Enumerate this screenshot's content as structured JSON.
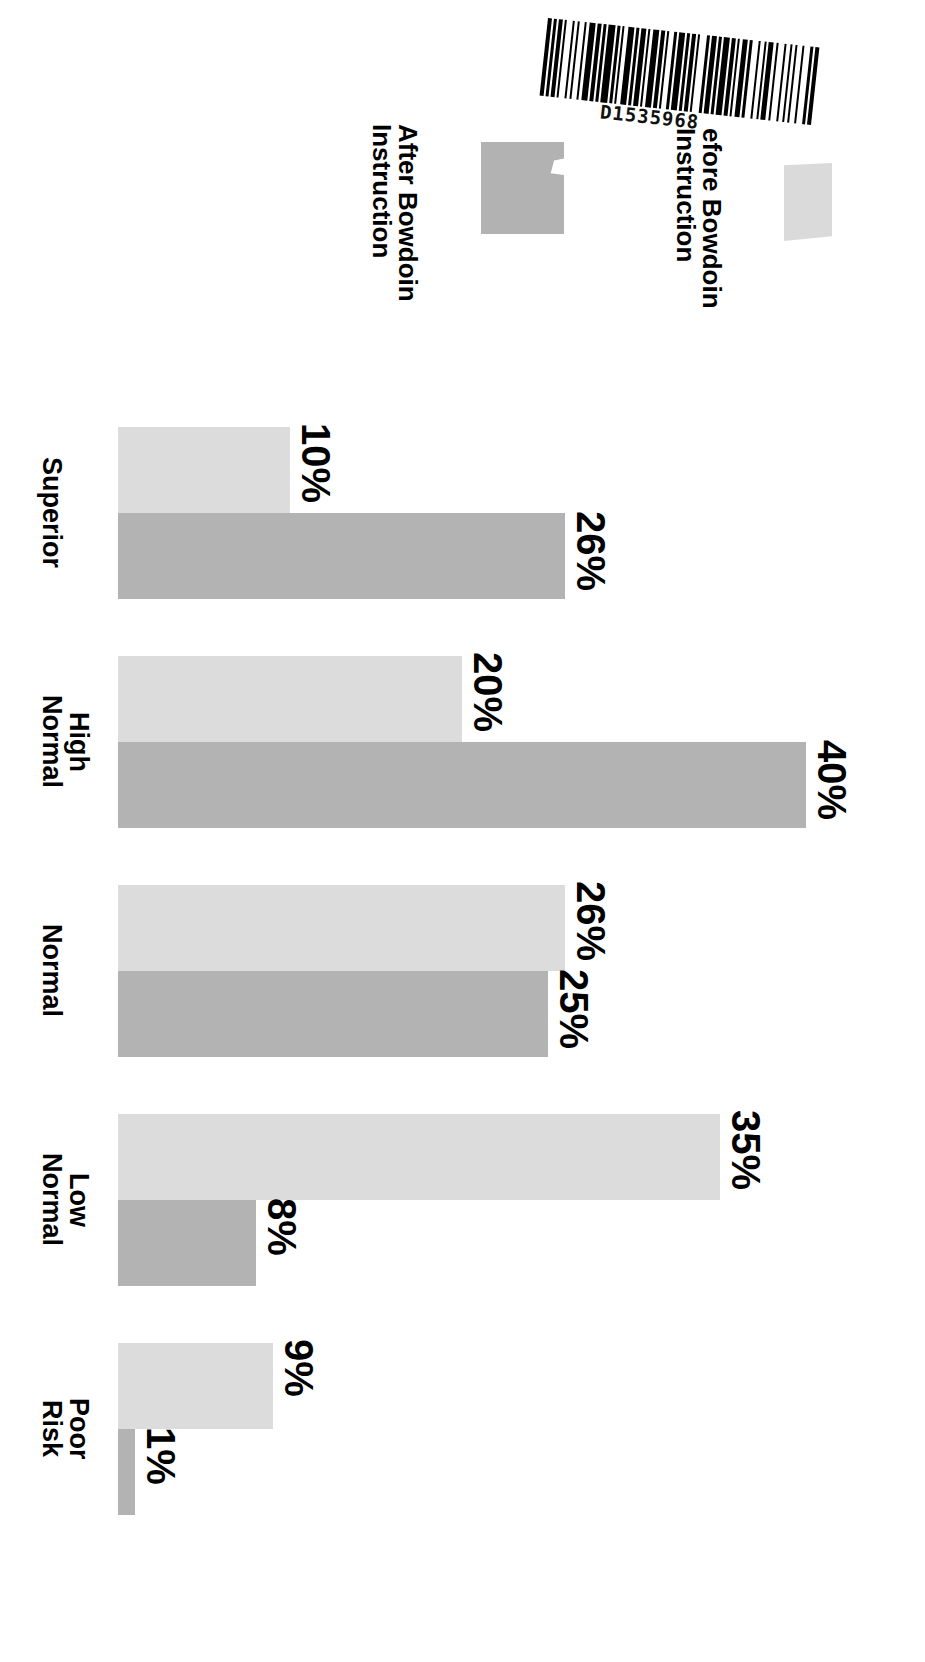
{
  "barcode": {
    "name": "barcode",
    "text": "D1535968"
  },
  "legend": {
    "entries": [
      {
        "key": "after",
        "label": "After Bowdoin\nInstruction",
        "swatch_color": "#b2b2b2",
        "series": "After Bowdoin Instruction"
      },
      {
        "key": "before",
        "label": "efore Bowdoin\nInstruction",
        "swatch_color": "#dadada",
        "series": "Before Bowdoin Instruction"
      }
    ]
  },
  "chart_data": {
    "type": "bar",
    "orientation": "horizontal",
    "title": "",
    "subtitle": "",
    "xlabel": "",
    "ylabel": "",
    "grid": false,
    "legend_position": "top",
    "value_suffix": "%",
    "categories": [
      "Superior",
      "High\nNormal",
      "Normal",
      "Low\nNormal",
      "Poor\nRisk"
    ],
    "series": [
      {
        "name": "Before Bowdoin Instruction",
        "color": "#dcdcdc",
        "values": [
          10,
          20,
          26,
          35,
          9
        ],
        "labels": [
          "10%",
          "20%",
          "26%",
          "35%",
          "9%"
        ]
      },
      {
        "name": "After Bowdoin Instruction",
        "color": "#b3b3b3",
        "values": [
          26,
          40,
          25,
          8,
          1
        ],
        "labels": [
          "26%",
          "40%",
          "25%",
          "8%",
          "1%"
        ]
      }
    ],
    "xlim": [
      0,
      40
    ]
  },
  "rows": [
    {
      "category": "Superior",
      "before_label": "10%",
      "after_label": "26%",
      "before_value": 10,
      "after_value": 26
    },
    {
      "category": "High\nNormal",
      "before_label": "20%",
      "after_label": "40%",
      "before_value": 20,
      "after_value": 40
    },
    {
      "category": "Normal",
      "before_label": "26%",
      "after_label": "25%",
      "before_value": 26,
      "after_value": 25
    },
    {
      "category": "Low\nNormal",
      "before_label": "35%",
      "after_label": "8%",
      "before_value": 35,
      "after_value": 8
    },
    {
      "category": "Poor\nRisk",
      "before_label": "9%",
      "after_label": "1%",
      "before_value": 9,
      "after_value": 1
    }
  ]
}
